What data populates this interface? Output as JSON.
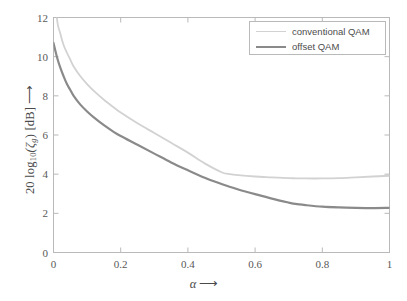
{
  "chart_data": {
    "type": "line",
    "title": "",
    "xlabel": "α ⟶",
    "ylabel": "20 log10(ζg) [dB] ⟶",
    "xlim": [
      0,
      1
    ],
    "ylim": [
      0,
      12
    ],
    "grid": false,
    "legend_position": "top-right",
    "xticks": [
      "0",
      "0.2",
      "0.4",
      "0.6",
      "0.8",
      "1"
    ],
    "xtick_values": [
      0,
      0.2,
      0.4,
      0.6,
      0.8,
      1
    ],
    "yticks": [
      "0",
      "2",
      "4",
      "6",
      "8",
      "10",
      "12"
    ],
    "ytick_values": [
      0,
      2,
      4,
      6,
      8,
      10,
      12
    ],
    "x": [
      0,
      0.01,
      0.02,
      0.03,
      0.04,
      0.05,
      0.06,
      0.08,
      0.1,
      0.12,
      0.15,
      0.18,
      0.2,
      0.25,
      0.3,
      0.35,
      0.4,
      0.45,
      0.5,
      0.52,
      0.55,
      0.6,
      0.65,
      0.7,
      0.72,
      0.75,
      0.8,
      0.85,
      0.9,
      0.95,
      1.0
    ],
    "series": [
      {
        "name": "conventional QAM",
        "color": "#d2d2d2",
        "width": 1.8,
        "values": [
          14.8,
          12.0,
          11.2,
          10.6,
          10.2,
          9.85,
          9.5,
          9.0,
          8.6,
          8.25,
          7.8,
          7.4,
          7.15,
          6.6,
          6.1,
          5.6,
          5.1,
          4.55,
          4.1,
          4.02,
          3.95,
          3.88,
          3.84,
          3.8,
          3.79,
          3.78,
          3.78,
          3.8,
          3.84,
          3.88,
          3.92
        ]
      },
      {
        "name": "offset QAM",
        "color": "#8a8a8a",
        "width": 2.2,
        "values": [
          10.7,
          10.0,
          9.45,
          9.0,
          8.6,
          8.3,
          8.0,
          7.55,
          7.2,
          6.9,
          6.5,
          6.15,
          5.95,
          5.5,
          5.05,
          4.6,
          4.2,
          3.82,
          3.5,
          3.38,
          3.22,
          2.98,
          2.75,
          2.55,
          2.48,
          2.42,
          2.34,
          2.3,
          2.28,
          2.27,
          2.28
        ]
      }
    ]
  },
  "legend": {
    "entries": [
      {
        "label": "conventional QAM"
      },
      {
        "label": "offset QAM"
      }
    ]
  },
  "axes": {
    "y_label_prefix": "20 log",
    "y_label_sub1": "10",
    "y_label_mid": "(ζ",
    "y_label_sub2": "g",
    "y_label_suffix": ") [dB]",
    "y_label_arrow": "⟶",
    "x_label_symbol": "α",
    "x_label_arrow": "⟶"
  },
  "style": {
    "axis_color": "#b9b9b9",
    "tick_color": "#585858",
    "background": "#ffffff"
  }
}
